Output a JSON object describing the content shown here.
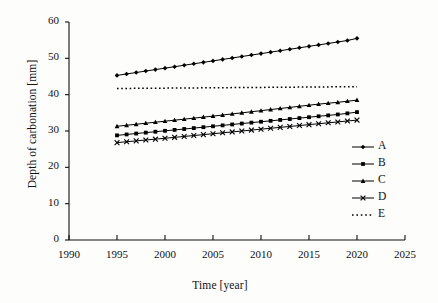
{
  "chart_data": {
    "type": "line",
    "title": "",
    "xlabel": "Time [year]",
    "ylabel": "Depth of carbonation [mm]",
    "xlim": [
      1990,
      2025
    ],
    "ylim": [
      0,
      60
    ],
    "xticks": [
      1990,
      1995,
      2000,
      2005,
      2010,
      2015,
      2020,
      2025
    ],
    "yticks": [
      0,
      10,
      20,
      30,
      40,
      50,
      60
    ],
    "grid": false,
    "legend_position": "right",
    "x": [
      1995,
      1996,
      1997,
      1998,
      1999,
      2000,
      2001,
      2002,
      2003,
      2004,
      2005,
      2006,
      2007,
      2008,
      2009,
      2010,
      2011,
      2012,
      2013,
      2014,
      2015,
      2016,
      2017,
      2018,
      2019,
      2020
    ],
    "series": [
      {
        "name": "A",
        "marker": "diamond",
        "linestyle": "solid",
        "color": "#000000",
        "values": [
          45.3,
          45.7,
          46.1,
          46.5,
          46.9,
          47.3,
          47.7,
          48.1,
          48.5,
          48.9,
          49.3,
          49.7,
          50.1,
          50.5,
          50.9,
          51.3,
          51.7,
          52.1,
          52.5,
          52.9,
          53.3,
          53.7,
          54.1,
          54.5,
          54.9,
          55.5
        ]
      },
      {
        "name": "B",
        "marker": "square",
        "linestyle": "solid",
        "color": "#000000",
        "values": [
          28.8,
          29.05,
          29.3,
          29.55,
          29.8,
          30.05,
          30.3,
          30.55,
          30.8,
          31.05,
          31.3,
          31.55,
          31.8,
          32.05,
          32.3,
          32.55,
          32.8,
          33.05,
          33.3,
          33.55,
          33.8,
          34.05,
          34.3,
          34.55,
          34.85,
          35.2
        ]
      },
      {
        "name": "C",
        "marker": "triangle",
        "linestyle": "solid",
        "color": "#000000",
        "values": [
          31.3,
          31.58,
          31.86,
          32.14,
          32.42,
          32.7,
          32.98,
          33.26,
          33.54,
          33.82,
          34.1,
          34.4,
          34.7,
          35.0,
          35.3,
          35.6,
          35.9,
          36.2,
          36.5,
          36.8,
          37.1,
          37.4,
          37.65,
          37.9,
          38.2,
          38.5
        ]
      },
      {
        "name": "D",
        "marker": "cross",
        "linestyle": "solid",
        "color": "#000000",
        "values": [
          26.8,
          27.04,
          27.28,
          27.52,
          27.76,
          28.0,
          28.25,
          28.5,
          28.75,
          29.0,
          29.25,
          29.5,
          29.75,
          30.0,
          30.25,
          30.5,
          30.75,
          31.0,
          31.25,
          31.5,
          31.75,
          32.0,
          32.25,
          32.5,
          32.75,
          33.0
        ]
      },
      {
        "name": "E",
        "marker": "none",
        "linestyle": "dotted",
        "color": "#000000",
        "values": [
          41.7,
          41.72,
          41.74,
          41.76,
          41.78,
          41.8,
          41.82,
          41.84,
          41.86,
          41.88,
          41.9,
          41.92,
          41.94,
          41.96,
          41.98,
          42.0,
          42.02,
          42.04,
          42.06,
          42.08,
          42.1,
          42.12,
          42.14,
          42.16,
          42.18,
          42.2
        ]
      }
    ]
  },
  "legend": {
    "entries": [
      {
        "label": "A"
      },
      {
        "label": "B"
      },
      {
        "label": "C"
      },
      {
        "label": "D"
      },
      {
        "label": "E"
      }
    ]
  }
}
